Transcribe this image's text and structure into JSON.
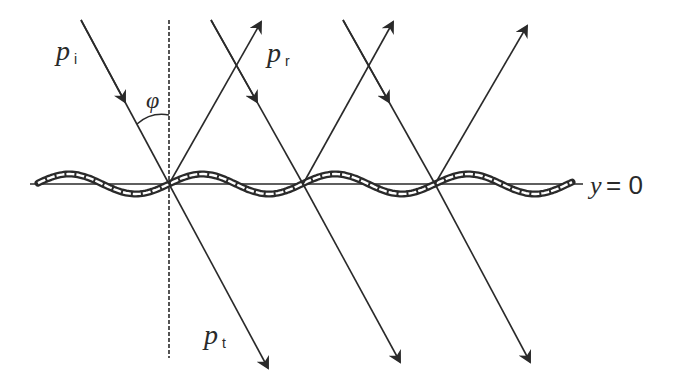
{
  "diagram": {
    "labels": {
      "incident": "p",
      "incident_sub": "i",
      "reflected": "p",
      "reflected_sub": "r",
      "transmitted": "p",
      "transmitted_sub": "t",
      "angle": "φ",
      "surface_var": "y",
      "surface_eq": "= 0"
    },
    "colors": {
      "line": "#2a2a2a",
      "background": "#ffffff"
    },
    "contact_points": [
      [
        169,
        184
      ],
      [
        303,
        184
      ],
      [
        435,
        184
      ]
    ],
    "surface_wave": {
      "baseline_y": 184,
      "amplitude": 10,
      "period": 133,
      "x_start": 38,
      "x_end": 572
    }
  }
}
